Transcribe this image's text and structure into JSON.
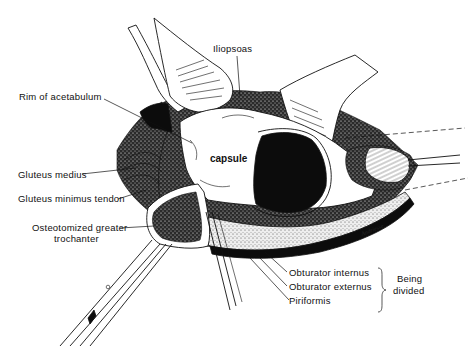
{
  "figure": {
    "type": "surgical anatomy line illustration"
  },
  "labels": {
    "iliopsoas": "Iliopsoas",
    "rim_of_acetabulum": "Rim of acetabulum",
    "capsule": "capsule",
    "gluteus_medius": "Gluteus medius",
    "gluteus_minimus_tendon": "Gluteus minimus tendon",
    "osteotomized_line1": "Osteotomized greater",
    "osteotomized_line2": "trochanter",
    "obturator_internus": "Obturator internus",
    "obturator_externus": "Obturator externus",
    "piriformis": "Piriformis",
    "being": "Being",
    "divided": "divided"
  },
  "signature": "Andriesse"
}
